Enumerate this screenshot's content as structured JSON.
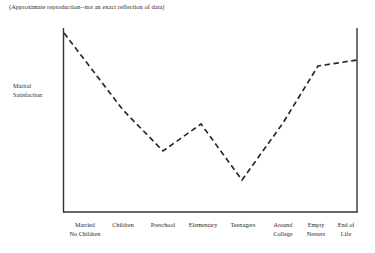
{
  "caption": "(Approximate reproduction--not an exact reflection of data)",
  "axis": {
    "ylabel_line1": "Marital",
    "ylabel_line2": "Satisfaction"
  },
  "style": {
    "axis_color": "#333333",
    "line_color": "#2a2a2a",
    "text_color": "#2b2b2b",
    "background": "#ffffff"
  },
  "chart_data": {
    "type": "line",
    "title": "",
    "subtitle": "(Approximate reproduction--not an exact reflection of data)",
    "xlabel": "",
    "ylabel": "Marital Satisfaction",
    "grid": false,
    "legend": false,
    "line_style": "dashed",
    "axis_ticks": "none",
    "ylim": [
      0,
      10
    ],
    "categories": [
      "Married No Children",
      "Children",
      "Preschool",
      "Elementary",
      "Teenagers",
      "Around College",
      "Empty Nesters",
      "End of Life"
    ],
    "category_labels": [
      {
        "line1": "Married",
        "line2": "No Children",
        "x": 85
      },
      {
        "line1": "Children",
        "line2": "",
        "x": 123
      },
      {
        "line1": "Preschool",
        "line2": "",
        "x": 163
      },
      {
        "line1": "Elementary",
        "line2": "",
        "x": 203
      },
      {
        "line1": "Teenagers",
        "line2": "",
        "x": 243
      },
      {
        "line1": "Around",
        "line2": "College",
        "x": 283
      },
      {
        "line1": "Empty",
        "line2": "Nesters",
        "x": 316
      },
      {
        "line1": "End of",
        "line2": "Life",
        "x": 346
      }
    ],
    "values": [
      9.7,
      6.2,
      3.9,
      5.3,
      2.3,
      5.6,
      8.9,
      9.2
    ],
    "points_px": [
      {
        "x": 64,
        "y": 33
      },
      {
        "x": 123,
        "y": 110
      },
      {
        "x": 163,
        "y": 151
      },
      {
        "x": 201,
        "y": 124
      },
      {
        "x": 242,
        "y": 180
      },
      {
        "x": 283,
        "y": 123
      },
      {
        "x": 318,
        "y": 66
      },
      {
        "x": 357,
        "y": 60
      }
    ]
  }
}
